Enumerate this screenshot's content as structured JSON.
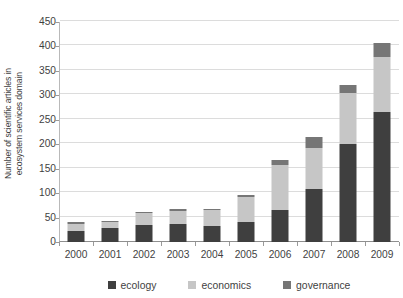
{
  "chart_data": {
    "type": "bar",
    "subtype": "stacked-vertical",
    "title": "",
    "xlabel": "",
    "ylabel": "Number of scientific articles in ecosystem services domain",
    "ylabel_lines": [
      "Number of scientific articles in",
      "ecosystem services domain"
    ],
    "categories": [
      "2000",
      "2001",
      "2002",
      "2003",
      "2004",
      "2005",
      "2006",
      "2007",
      "2008",
      "2009"
    ],
    "series": [
      {
        "name": "ecology",
        "color": "#3f3f3f",
        "values": [
          23,
          28,
          35,
          37,
          32,
          40,
          65,
          108,
          200,
          265
        ]
      },
      {
        "name": "economics",
        "color": "#c6c6c6",
        "values": [
          14,
          12,
          24,
          27,
          33,
          52,
          93,
          85,
          105,
          113
        ]
      },
      {
        "name": "governance",
        "color": "#767676",
        "values": [
          3,
          2,
          3,
          3,
          3,
          5,
          10,
          22,
          17,
          29
        ]
      }
    ],
    "totals": [
      40,
      42,
      62,
      67,
      68,
      97,
      168,
      215,
      322,
      407
    ],
    "ylim": [
      0,
      450
    ],
    "ytick_step": 50,
    "ytick_labels": [
      "0",
      "50",
      "100",
      "150",
      "200",
      "250",
      "300",
      "350",
      "400",
      "450"
    ],
    "grid": true,
    "grid_axis": "y",
    "legend_position": "bottom",
    "legend_entries": [
      "ecology",
      "economics",
      "governance"
    ]
  },
  "colors": {
    "ecology": "#3f3f3f",
    "economics": "#c6c6c6",
    "governance": "#767676",
    "gridline": "#dcdcdc",
    "axis": "#8f8f8f",
    "text": "#3f3f3f",
    "background": "#ffffff"
  }
}
